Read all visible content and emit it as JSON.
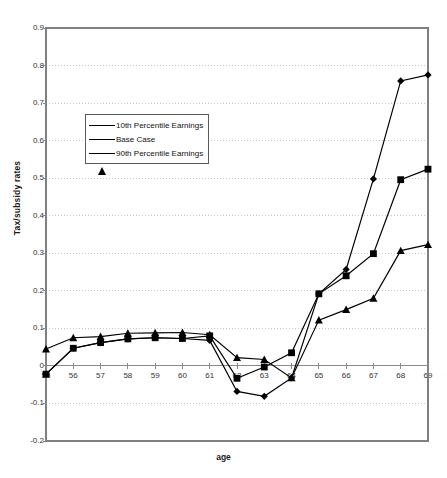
{
  "chart_data": {
    "type": "line",
    "title": "",
    "xlabel": "age",
    "ylabel": "Tax/subsidy rates",
    "x": [
      55,
      56,
      57,
      58,
      59,
      60,
      61,
      62,
      63,
      64,
      65,
      66,
      67,
      68,
      69
    ],
    "categories": [
      "55",
      "56",
      "57",
      "58",
      "59",
      "60",
      "61",
      "62",
      "63",
      "64",
      "65",
      "66",
      "67",
      "68",
      "69"
    ],
    "xlim": [
      55,
      69
    ],
    "ylim": [
      -0.2,
      0.9
    ],
    "ytick_labels": [
      "0.9",
      "0.8",
      "0.7",
      "0.6",
      "0.5",
      "0.4",
      "0.3",
      "0.2",
      "0.1",
      "0",
      "-0.1",
      "-0.2"
    ],
    "ytick_values": [
      0.9,
      0.8,
      0.7,
      0.6,
      0.5,
      0.4,
      0.3,
      0.2,
      0.1,
      0,
      -0.1,
      -0.2
    ],
    "grid": "horizontal-dotted",
    "legend_position": "upper-left-inside",
    "series": [
      {
        "name": "10th Percentile Earnings",
        "marker": "diamond",
        "values": [
          -0.022,
          0.047,
          0.062,
          0.072,
          0.075,
          0.073,
          0.068,
          -0.068,
          -0.081,
          -0.032,
          0.192,
          0.257,
          0.498,
          0.759,
          0.775
        ]
      },
      {
        "name": "Base Case",
        "marker": "square",
        "values": [
          -0.022,
          0.047,
          0.062,
          0.072,
          0.075,
          0.073,
          0.08,
          -0.033,
          -0.003,
          0.035,
          0.192,
          0.24,
          0.299,
          0.496,
          0.524
        ]
      },
      {
        "name": "90th Percentile Earnings",
        "marker": "triangle",
        "values": [
          0.045,
          0.075,
          0.078,
          0.087,
          0.088,
          0.089,
          0.083,
          0.022,
          0.017,
          -0.032,
          0.122,
          0.15,
          0.18,
          0.307,
          0.323
        ]
      }
    ]
  },
  "legend": {
    "items": [
      {
        "label": "10th Percentile Earnings",
        "marker": "diamond"
      },
      {
        "label": "Base Case",
        "marker": "square"
      },
      {
        "label": "90th Percentile Earnings",
        "marker": "triangle"
      }
    ]
  },
  "colors": {
    "series": "#000000",
    "axis": "#808080",
    "grid": "#c8c8c8",
    "border": "#808080",
    "background": "#ffffff"
  }
}
